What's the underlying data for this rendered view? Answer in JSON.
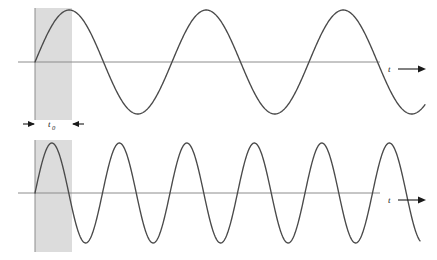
{
  "figure": {
    "caption": "",
    "background_color": "#ffffff",
    "width": 437,
    "height": 260
  },
  "style": {
    "curve_color": "#4a4a4a",
    "axis_color": "#8c8c8c",
    "shade_color": "#dcdcdc",
    "marker_color": "#1a1a1a",
    "text_color": "#1a1a1a"
  },
  "annotations": {
    "time_axis_label_top": "t",
    "time_axis_label_bottom": "t",
    "duration_label_base": "t",
    "duration_label_subscript": "0"
  },
  "chart_data": {
    "type": "line",
    "title": "",
    "xlabel": "t",
    "ylabel": "",
    "grid": false,
    "legend_position": "none",
    "shaded_region": {
      "name": "gate-window",
      "x_start_px": 35,
      "x_end_px": 72,
      "label": "t0",
      "color": "#dcdcdc"
    },
    "series": [
      {
        "name": "low-frequency-sine",
        "panel": "top",
        "waveform": "sine",
        "amplitude_px": 52,
        "period_px": 137,
        "phase_deg": 0,
        "baseline_y_px": 62,
        "x_start_px": 35,
        "x_end_px": 425,
        "cycles_visible": 2.85,
        "axis_y_px": 62,
        "axis_x_start_px": 18,
        "axis_x_end_px": 380,
        "axis_label": "t"
      },
      {
        "name": "high-frequency-sine",
        "panel": "bottom",
        "waveform": "sine",
        "amplitude_px": 50,
        "period_px": 67.5,
        "phase_deg": 0,
        "baseline_y_px": 193,
        "x_start_px": 35,
        "x_end_px": 420,
        "cycles_visible": 5.7,
        "axis_y_px": 193,
        "axis_x_start_px": 18,
        "axis_x_end_px": 380,
        "axis_label": "t"
      }
    ],
    "markers": {
      "vertical_gate_lines_x_px": [
        35
      ],
      "dimension_arrow_y_px": 124,
      "dimension_arrow_left_x_px": 24,
      "dimension_arrow_right_x_px": 83,
      "dimension_label_x_px": 52
    }
  }
}
